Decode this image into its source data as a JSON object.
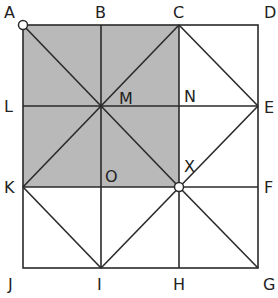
{
  "diagram": {
    "type": "geometry-square-grid",
    "colors": {
      "shade": "#b9b9b9",
      "line": "#2a2a2a",
      "label": "#222222",
      "open_point_fill": "#ffffff"
    },
    "points": {
      "A": {
        "label": "A",
        "x": 23,
        "y": 25
      },
      "B": {
        "label": "B",
        "x": 101,
        "y": 25
      },
      "C": {
        "label": "C",
        "x": 179,
        "y": 25
      },
      "D": {
        "label": "D",
        "x": 258,
        "y": 25
      },
      "E": {
        "label": "E",
        "x": 258,
        "y": 106
      },
      "F": {
        "label": "F",
        "x": 258,
        "y": 187
      },
      "G": {
        "label": "G",
        "x": 258,
        "y": 268
      },
      "H": {
        "label": "H",
        "x": 179,
        "y": 268
      },
      "I": {
        "label": "I",
        "x": 101,
        "y": 268
      },
      "J": {
        "label": "J",
        "x": 23,
        "y": 268
      },
      "K": {
        "label": "K",
        "x": 23,
        "y": 187
      },
      "L": {
        "label": "L",
        "x": 23,
        "y": 106
      },
      "M": {
        "label": "M",
        "x": 101,
        "y": 106
      },
      "N": {
        "label": "N",
        "x": 179,
        "y": 106
      },
      "O": {
        "label": "O",
        "x": 101,
        "y": 187
      },
      "X": {
        "label": "X",
        "x": 179,
        "y": 187
      }
    },
    "shaded_region": [
      "A",
      "C",
      "X",
      "K"
    ],
    "open_points": [
      "A",
      "X"
    ]
  }
}
